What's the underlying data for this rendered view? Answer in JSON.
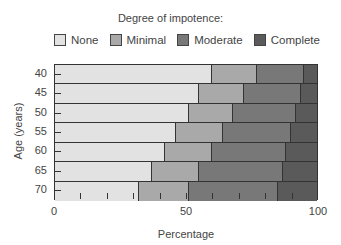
{
  "chart_data": {
    "type": "bar",
    "orientation": "horizontal",
    "stacked": true,
    "title": "",
    "legend_title": "Degree of impotence:",
    "legend_position": "top",
    "xlabel": "Percentage",
    "ylabel": "Age (years)",
    "xlim": [
      0,
      100
    ],
    "xticks": [
      "0",
      "50",
      "100"
    ],
    "grid": false,
    "categories": [
      "40",
      "45",
      "50",
      "55",
      "60",
      "65",
      "70"
    ],
    "series": [
      {
        "name": "None",
        "color": "#e2e2e2",
        "values": [
          60,
          55,
          51,
          46,
          42,
          37,
          32
        ]
      },
      {
        "name": "Minimal",
        "color": "#a9a9a9",
        "values": [
          17,
          17,
          17,
          18,
          18,
          18,
          19
        ]
      },
      {
        "name": "Moderate",
        "color": "#787878",
        "values": [
          18,
          22,
          24,
          26,
          28,
          32,
          34
        ]
      },
      {
        "name": "Complete",
        "color": "#5a5a5a",
        "values": [
          5,
          6,
          8,
          10,
          12,
          13,
          15
        ]
      }
    ]
  }
}
